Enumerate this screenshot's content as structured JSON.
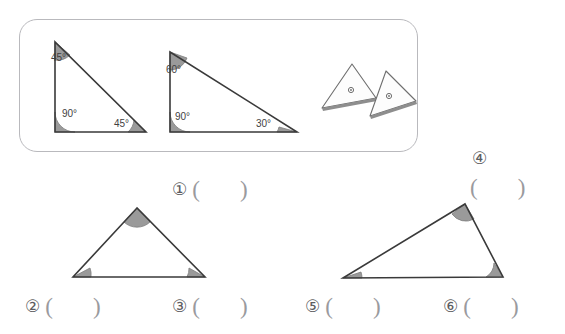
{
  "page": {
    "background_color": "#ffffff",
    "width": 565,
    "height": 334
  },
  "reference_box": {
    "name": "reference-examples-box",
    "border_color": "#b9b9bd",
    "examples": [
      {
        "id": "example-triangle-1",
        "type": "right isosceles triangle",
        "angle_labels": [
          "45°",
          "90°",
          "45°"
        ],
        "angles": [
          45,
          90,
          45
        ]
      },
      {
        "id": "example-triangle-2",
        "type": "right scalene triangle",
        "angle_labels": [
          "60°",
          "90°",
          "30°"
        ],
        "angles": [
          60,
          90,
          30
        ]
      }
    ],
    "icon_triangles": [
      {
        "id": "icon-triangle-left",
        "marker": "dot"
      },
      {
        "id": "icon-triangle-right",
        "marker": "dot"
      }
    ]
  },
  "questions": {
    "left_figure": {
      "name": "isosceles-triangle-figure",
      "slots": [
        {
          "number": "①",
          "open": "(",
          "close": ")",
          "answer": ""
        },
        {
          "number": "②",
          "open": "(",
          "close": ")",
          "answer": ""
        },
        {
          "number": "③",
          "open": "(",
          "close": ")",
          "answer": ""
        }
      ]
    },
    "right_figure": {
      "name": "obtuse-triangle-figure",
      "slots": [
        {
          "number": "④",
          "open": "(",
          "close": ")",
          "answer": ""
        },
        {
          "number": "⑤",
          "open": "(",
          "close": ")",
          "answer": ""
        },
        {
          "number": "⑥",
          "open": "(",
          "close": ")",
          "answer": ""
        }
      ]
    }
  },
  "colors": {
    "stroke": "#3a3a3a",
    "arc_fill": "#9a9a9a",
    "arc_stroke": "#7d7d7d",
    "box_border": "#b9b9bd",
    "slot_text": "#8a8a8e",
    "label_text": "#3f3f3f"
  }
}
